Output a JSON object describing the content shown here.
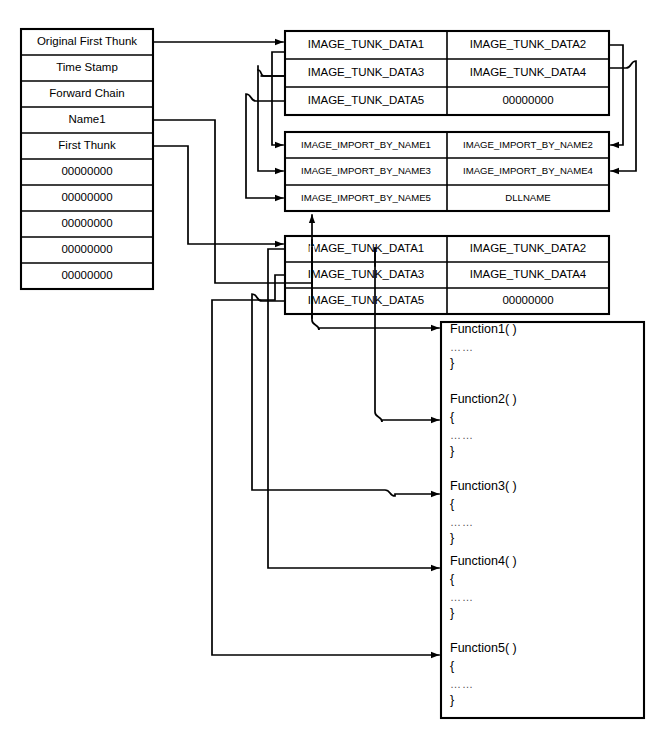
{
  "diagram": {
    "stroke_color": "#000000",
    "background_color": "#ffffff",
    "import_descriptor": {
      "name": "import-descriptor-table",
      "rows": [
        "Original First Thunk",
        "Time Stamp",
        "Forward Chain",
        "Name1",
        "First Thunk",
        "00000000",
        "00000000",
        "00000000",
        "00000000",
        "00000000"
      ]
    },
    "thunk_table_top": {
      "name": "image-thunk-data-table-top",
      "rows": [
        [
          "IMAGE_TUNK_DATA1",
          "IMAGE_TUNK_DATA2"
        ],
        [
          "IMAGE_TUNK_DATA3",
          "IMAGE_TUNK_DATA4"
        ],
        [
          "IMAGE_TUNK_DATA5",
          "00000000"
        ]
      ]
    },
    "import_by_name_table": {
      "name": "image-import-by-name-table",
      "rows": [
        [
          "IMAGE_IMPORT_BY_NAME1",
          "IMAGE_IMPORT_BY_NAME2"
        ],
        [
          "IMAGE_IMPORT_BY_NAME3",
          "IMAGE_IMPORT_BY_NAME4"
        ],
        [
          "IMAGE_IMPORT_BY_NAME5",
          "DLLNAME"
        ]
      ]
    },
    "thunk_table_bottom": {
      "name": "image-thunk-data-table-bottom",
      "rows": [
        [
          "IMAGE_TUNK_DATA1",
          "IMAGE_TUNK_DATA2"
        ],
        [
          "IMAGE_TUNK_DATA3",
          "IMAGE_TUNK_DATA4"
        ],
        [
          "IMAGE_TUNK_DATA5",
          "00000000"
        ]
      ]
    },
    "function_box": {
      "name": "function-code-box",
      "open_brace": "{",
      "close_brace": "}",
      "ellipsis": "……",
      "functions": [
        "Function1( )",
        "Function2( )",
        "Function3( )",
        "Function4( )",
        "Function5( )"
      ]
    }
  }
}
